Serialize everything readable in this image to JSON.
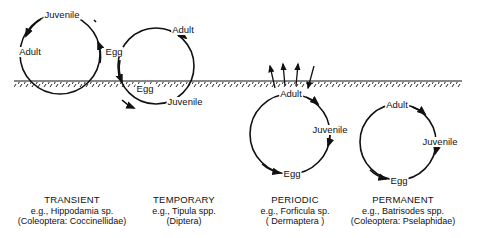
{
  "diagram": {
    "ground": {
      "label": "soil surface",
      "y": 81
    },
    "cycles": [
      {
        "id": "transient",
        "stages": {
          "top": "Juvenile",
          "left": "Adult",
          "right": "Egg"
        },
        "caption": {
          "title": "TRANSIENT",
          "example": "e.g., Hippodamia sp.",
          "taxon": "(Coleoptera: Coccinellidae)"
        }
      },
      {
        "id": "temporary",
        "stages": {
          "top": "Adult",
          "bottom_left": "Egg",
          "bottom": "Juvenile"
        },
        "caption": {
          "title": "TEMPORARY",
          "example": "e.g., Tipula spp.",
          "taxon": "(Diptera)"
        }
      },
      {
        "id": "periodic",
        "stages": {
          "top": "Adult",
          "right": "Juvenile",
          "bottom": "Egg"
        },
        "caption": {
          "title": "PERIODIC",
          "example": "e.g., Forficula sp.",
          "taxon": "( Dermaptera )"
        }
      },
      {
        "id": "permanent",
        "stages": {
          "top": "Adult",
          "right": "Juvenile",
          "bottom": "Egg"
        },
        "caption": {
          "title": "PERMANENT",
          "example": "e.g., Batrisodes spp.",
          "taxon": "(Coleoptera: Pselaphidae)"
        }
      }
    ]
  }
}
